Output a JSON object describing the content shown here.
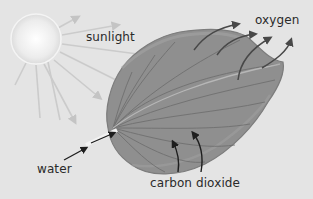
{
  "diagram": {
    "labels": {
      "sunlight": "sunlight",
      "oxygen": "oxygen",
      "water": "water",
      "carbon_dioxide": "carbon dioxide"
    },
    "elements": [
      "sun",
      "leaf",
      "sunlight-rays",
      "oxygen-arrows",
      "water-arrow",
      "carbon-dioxide-arrows"
    ],
    "colors": {
      "background": "#e4e4e4",
      "leaf": "#8f8f8f",
      "leaf_dark": "#7a7a7a",
      "sun": "#f4f4f4",
      "arrows": "#1e1e1e",
      "rays": "#c9c9c9"
    }
  }
}
